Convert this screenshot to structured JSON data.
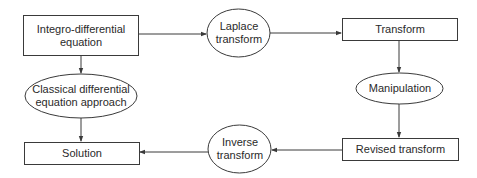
{
  "diagram": {
    "type": "flowchart",
    "nodes": [
      {
        "id": "integro",
        "shape": "rect",
        "label": "Integro-differential\nequation"
      },
      {
        "id": "laplace",
        "shape": "ellipse",
        "label": "Laplace\ntransform"
      },
      {
        "id": "transform",
        "shape": "rect",
        "label": "Transform"
      },
      {
        "id": "manipulation",
        "shape": "ellipse",
        "label": "Manipulation"
      },
      {
        "id": "revised",
        "shape": "rect",
        "label": "Revised transform"
      },
      {
        "id": "inverse",
        "shape": "ellipse",
        "label": "Inverse\ntransform"
      },
      {
        "id": "solution",
        "shape": "rect",
        "label": "Solution"
      },
      {
        "id": "classical",
        "shape": "ellipse",
        "label": "Classical differential\nequation approach"
      }
    ],
    "edges": [
      {
        "from": "integro",
        "to": "laplace"
      },
      {
        "from": "laplace",
        "to": "transform"
      },
      {
        "from": "transform",
        "to": "manipulation"
      },
      {
        "from": "manipulation",
        "to": "revised"
      },
      {
        "from": "revised",
        "to": "inverse"
      },
      {
        "from": "inverse",
        "to": "solution"
      },
      {
        "from": "integro",
        "to": "classical"
      },
      {
        "from": "classical",
        "to": "solution"
      }
    ]
  },
  "labels": {
    "integro": "Integro-differential\nequation",
    "laplace": "Laplace\ntransform",
    "transform": "Transform",
    "manipulation": "Manipulation",
    "revised": "Revised transform",
    "inverse": "Inverse\ntransform",
    "solution": "Solution",
    "classical": "Classical differential\nequation approach"
  },
  "colors": {
    "stroke": "#3a3a3a",
    "text": "#2a2a2a",
    "background": "#ffffff"
  }
}
